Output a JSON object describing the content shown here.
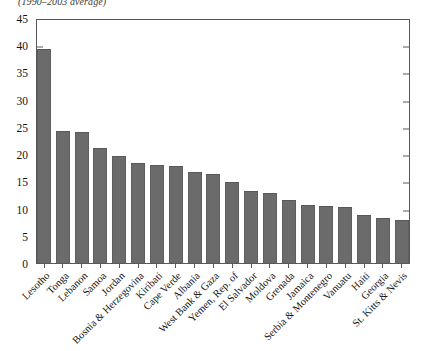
{
  "caption": "(1990–2003 average)",
  "chart_data": {
    "type": "bar",
    "title": "(1990–2003 average)",
    "xlabel": "",
    "ylabel": "",
    "ylim": [
      0,
      45
    ],
    "yticks": [
      0,
      5,
      10,
      15,
      20,
      25,
      30,
      35,
      40,
      45
    ],
    "grid": false,
    "legend": "none",
    "bar_color": "#6b6b6b",
    "axis_color": "#55585c",
    "categories": [
      "Lesotho",
      "Tonga",
      "Lebanon",
      "Samoa",
      "Jordan",
      "Bosnia & Herzegovina",
      "Kiribati",
      "Cape Verde",
      "Albania",
      "West Bank & Gaza",
      "Yemen, Rep. of",
      "El Salvador",
      "Moldova",
      "Grenada",
      "Jamaica",
      "Serbia & Montenegro",
      "Vanuatu",
      "Haiti",
      "Georgia",
      "St. Kitts & Nevis"
    ],
    "values": [
      39.7,
      24.4,
      24.2,
      21.3,
      19.9,
      18.6,
      18.2,
      18.0,
      16.9,
      16.4,
      15.0,
      13.4,
      13.0,
      11.7,
      10.8,
      10.5,
      10.3,
      8.8,
      8.4,
      8.0
    ]
  }
}
